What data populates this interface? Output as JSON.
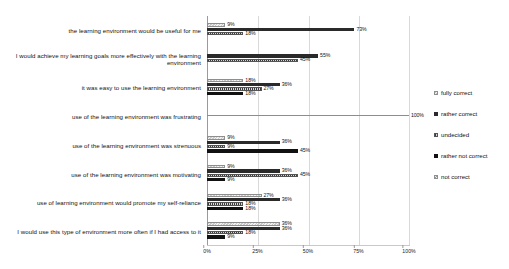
{
  "cut_strip": {
    "fragments": [
      {
        "text": "· ·",
        "left": 70
      },
      {
        "text": "·",
        "left": 196
      },
      {
        "text": "·",
        "left": 340
      },
      {
        "text": "·· ·",
        "left": 398
      },
      {
        "text": "·",
        "left": 448
      },
      {
        "text": "··",
        "left": 476
      }
    ]
  },
  "chart_data": {
    "type": "bar",
    "orientation": "horizontal",
    "title": "",
    "xlabel": "",
    "ylabel": "",
    "xlim": [
      0,
      100
    ],
    "xticks": [
      "0%",
      "25%",
      "50%",
      "75%",
      "100%"
    ],
    "grid": true,
    "legend_position": "right",
    "value_suffix": "%",
    "categories": [
      "the learning environment would be useful for me",
      "I would achieve my learning goals more effectively with the learning environment",
      "it was easy to use the learning environment",
      "use of the learning environment was frustrating",
      "use of the learning environment was strenuous",
      "use of the learning environment was motivating",
      "use of learning environment would promote my self-reliance",
      "I would use this type of environment more often if I had access to it"
    ],
    "series": [
      {
        "name": "fully correct",
        "values": [
          9,
          null,
          18,
          null,
          9,
          9,
          27,
          36
        ]
      },
      {
        "name": "rather correct",
        "values": [
          73,
          55,
          36,
          null,
          36,
          36,
          36,
          36
        ]
      },
      {
        "name": "undecided",
        "values": [
          18,
          45,
          27,
          null,
          9,
          45,
          18,
          18
        ]
      },
      {
        "name": "rather not correct",
        "values": [
          null,
          null,
          18,
          null,
          45,
          9,
          18,
          9
        ]
      },
      {
        "name": "not correct",
        "values": [
          null,
          null,
          null,
          100,
          null,
          null,
          null,
          null
        ]
      }
    ]
  },
  "legend": {
    "items": [
      {
        "label": "fully correct"
      },
      {
        "label": "rather correct"
      },
      {
        "label": "undecided"
      },
      {
        "label": "rather not correct"
      },
      {
        "label": "not correct"
      }
    ]
  }
}
